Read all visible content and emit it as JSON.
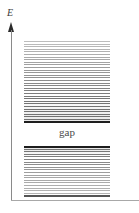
{
  "figure": {
    "background_color": "#ffffff",
    "width": 139,
    "height": 213
  },
  "axis": {
    "vertical_label": "E",
    "vertical_label_meaning": "Energy",
    "vertical_axis_color": "#8a8a8a",
    "horizontal_axis_color": "#a8a8a8",
    "arrowhead_color": "#2b2b2b",
    "arrow_direction": "up"
  },
  "gap": {
    "label": "gap"
  },
  "bands": {
    "upper": {
      "name": "upper-band",
      "edge_color": "#1e1e1e",
      "level_line_color": "#6f6f6f"
    },
    "lower": {
      "name": "lower-band",
      "edge_color": "#1e1e1e",
      "level_line_color": "#6f6f6f"
    }
  },
  "chart_data": {
    "type": "bar",
    "xlabel": "",
    "ylabel": "E",
    "grid": false,
    "legend": false,
    "orientation": "vertical",
    "categories": [
      "upper band",
      "gap",
      "lower band"
    ],
    "annotations": [
      "E",
      "gap"
    ],
    "bands": [
      {
        "name": "upper band",
        "y_bottom_px": 123,
        "y_top_px": 41,
        "x_left_px": 24,
        "x_right_px": 110,
        "fill": "horizontal energy levels, shading darkens downward",
        "approx_level_count": 32
      },
      {
        "name": "lower band",
        "y_bottom_px": 197,
        "y_top_px": 146,
        "x_left_px": 24,
        "x_right_px": 110,
        "fill": "horizontal energy levels, shading darkest at top",
        "approx_level_count": 20
      }
    ],
    "gap_region": {
      "label": "gap",
      "y_top_px": 123,
      "y_bottom_px": 146,
      "filled": false
    }
  }
}
